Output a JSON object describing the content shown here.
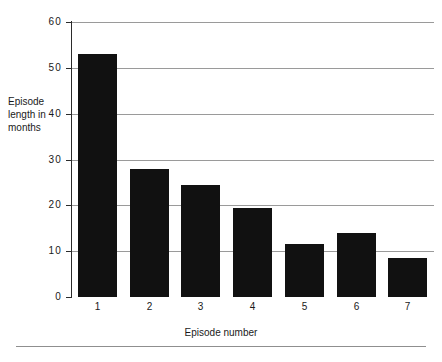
{
  "chart_data": {
    "type": "bar",
    "title": "",
    "xlabel": "Episode number",
    "ylabel": "Episode length in months",
    "categories": [
      "1",
      "2",
      "3",
      "4",
      "5",
      "6",
      "7"
    ],
    "values": [
      53,
      28,
      24.5,
      19.5,
      11.5,
      14,
      8.5
    ],
    "ylim": [
      0,
      60
    ],
    "yticks": [
      0,
      10,
      20,
      30,
      40,
      50,
      60
    ],
    "ytick_labels": [
      "0",
      "10",
      "20",
      "30",
      "40",
      "50",
      "60"
    ],
    "grid": "horizontal",
    "legend": "none",
    "bar_color": "#111111",
    "gridline_color": "#9a9a9a",
    "axis_color": "#2b2b2b",
    "background_color": "#ffffff"
  },
  "axis_titles": {
    "y_line_1": "Episode",
    "y_line_2": "length in",
    "y_line_3": "months",
    "x": "Episode number"
  }
}
